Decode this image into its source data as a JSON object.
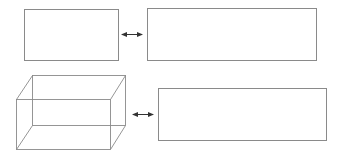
{
  "diagram": {
    "title": "",
    "colors": {
      "background": "#ffffff",
      "line": "#8a8a8a",
      "arrow": "#333333"
    },
    "rows": [
      {
        "left_shape": {
          "type": "rectangle",
          "x": 24,
          "y": 9,
          "w": 94,
          "h": 51,
          "label": ""
        },
        "connector": {
          "type": "double-arrow",
          "x1": 122,
          "x2": 142,
          "y": 34
        },
        "right_shape": {
          "type": "rectangle",
          "x": 147,
          "y": 8,
          "w": 169,
          "h": 52,
          "label": ""
        }
      },
      {
        "left_shape": {
          "type": "wireframe-box",
          "back": {
            "x": 32,
            "y": 75,
            "w": 93,
            "h": 50
          },
          "front": {
            "x": 16,
            "y": 99,
            "w": 94,
            "h": 50
          },
          "label": ""
        },
        "connector": {
          "type": "double-arrow",
          "x1": 133,
          "x2": 153,
          "y": 114
        },
        "right_shape": {
          "type": "rectangle",
          "x": 158,
          "y": 88,
          "w": 168,
          "h": 52,
          "label": ""
        }
      }
    ]
  }
}
